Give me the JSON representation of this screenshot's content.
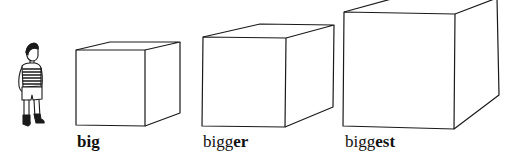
{
  "illustration": {
    "figure": "boy-standing",
    "cubes": [
      {
        "size": "small",
        "label_base": "big",
        "label_suffix": "",
        "label_bold_all": true
      },
      {
        "size": "medium",
        "label_base": "bigg",
        "label_suffix": "er",
        "label_bold_all": false
      },
      {
        "size": "large",
        "label_base": "bigg",
        "label_suffix": "est",
        "label_bold_all": false
      }
    ]
  },
  "labels": {
    "big": "big",
    "bigger_base": "bigg",
    "bigger_suffix": "er",
    "biggest_base": "bigg",
    "biggest_suffix": "est"
  },
  "colors": {
    "line": "#1a1a1a",
    "background": "#ffffff"
  }
}
